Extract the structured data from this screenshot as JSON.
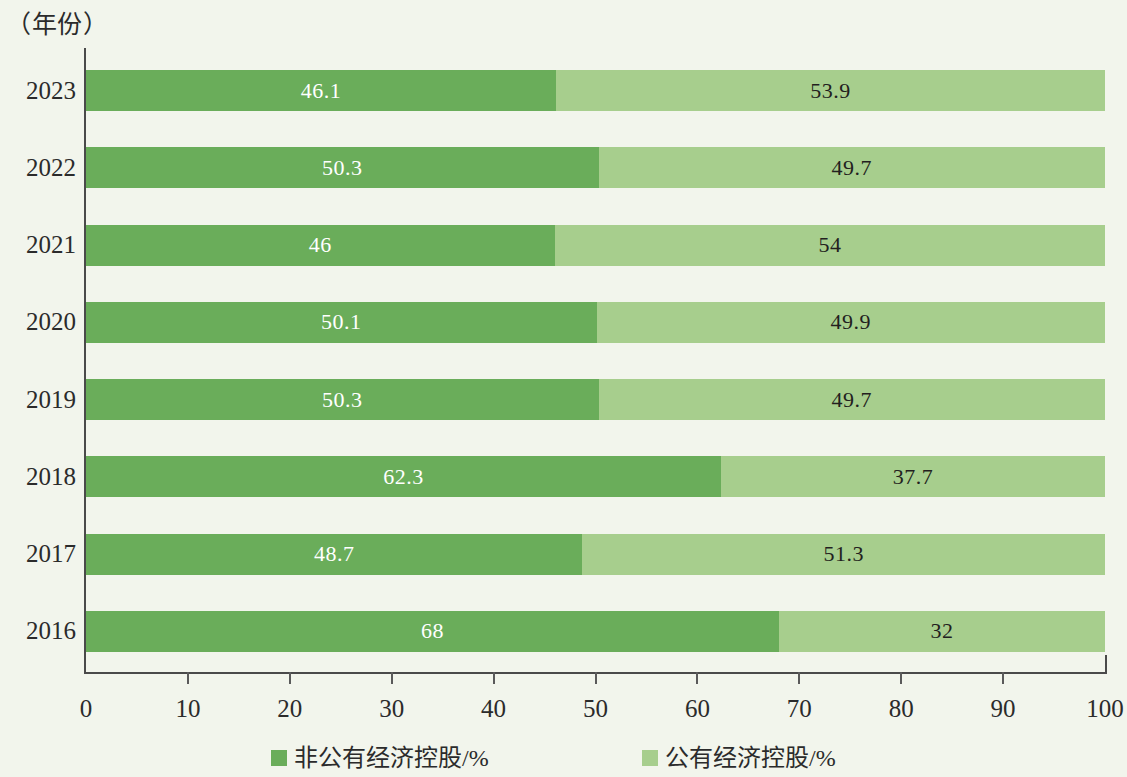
{
  "chart_data": {
    "type": "bar",
    "orientation": "horizontal",
    "stacked": true,
    "stack_total": 100,
    "title": "",
    "subtitle": "",
    "xlabel": "",
    "ylabel": "（年份）",
    "xlim": [
      0,
      100
    ],
    "xticks": [
      "0",
      "10",
      "20",
      "30",
      "40",
      "50",
      "60",
      "70",
      "80",
      "90",
      "100"
    ],
    "grid": false,
    "legend_position": "bottom",
    "categories": [
      "2023",
      "2022",
      "2021",
      "2020",
      "2019",
      "2018",
      "2017",
      "2016"
    ],
    "series": [
      {
        "name": "非公有经济控股/%",
        "color": "#6aad5a",
        "values": [
          46.1,
          50.3,
          46,
          50.1,
          50.3,
          62.3,
          48.7,
          68
        ],
        "labels": [
          "46.1",
          "50.3",
          "46",
          "50.1",
          "50.3",
          "62.3",
          "48.7",
          "68"
        ]
      },
      {
        "name": "公有经济控股/%",
        "color": "#a7ce8d",
        "values": [
          53.9,
          49.7,
          54,
          49.9,
          49.7,
          37.7,
          51.3,
          32
        ],
        "labels": [
          "53.9",
          "49.7",
          "54",
          "49.9",
          "49.7",
          "37.7",
          "51.3",
          "32"
        ]
      }
    ]
  },
  "colors": {
    "background": "#f2f5ec",
    "axis": "#4a4a4a",
    "text": "#2b2b2b",
    "series_private": "#6aad5a",
    "series_public": "#a7ce8d",
    "label_on_dark": "#ffffff"
  }
}
